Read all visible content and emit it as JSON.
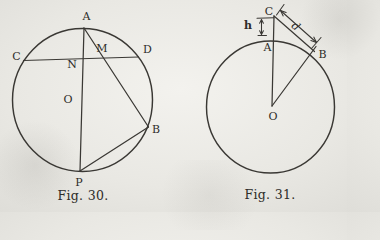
{
  "page": {
    "paper_color": "#e9e8e3",
    "ink_color": "#3a3834"
  },
  "fig30": {
    "caption": "Fig. 30.",
    "points": {
      "A": "A",
      "B": "B",
      "C": "C",
      "D": "D",
      "M": "M",
      "N": "N",
      "O": "O",
      "P": "P"
    }
  },
  "fig31": {
    "caption": "Fig. 31.",
    "points": {
      "A": "A",
      "B": "B",
      "C": "C",
      "O": "O"
    },
    "dims": {
      "h": "h",
      "d": "d"
    }
  }
}
